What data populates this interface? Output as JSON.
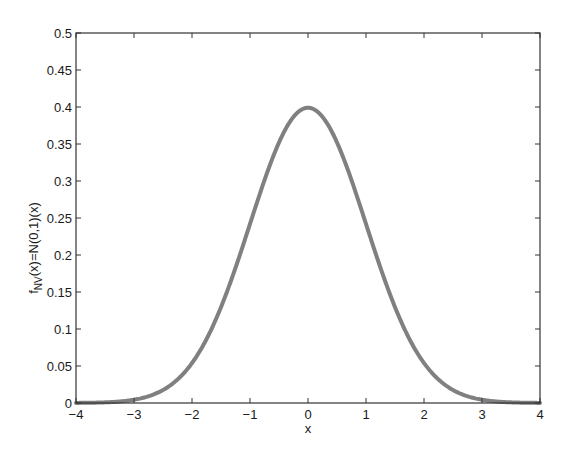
{
  "chart_data": {
    "type": "line",
    "title": "",
    "xlabel": "x",
    "ylabel": "f_NV(x)=N(0,1)(x)",
    "ylabel_parts": {
      "main": "f",
      "sub": "NV",
      "rest": "(x)=N(0,1)(x)"
    },
    "xlim": [
      -4,
      4
    ],
    "ylim": [
      0,
      0.5
    ],
    "xticks": [
      -4,
      -3,
      -2,
      -1,
      0,
      1,
      2,
      3,
      4
    ],
    "xtick_labels": [
      "-4",
      "-3",
      "-2",
      "-1",
      "0",
      "1",
      "2",
      "3",
      "4"
    ],
    "yticks": [
      0,
      0.05,
      0.1,
      0.15,
      0.2,
      0.25,
      0.3,
      0.35,
      0.4,
      0.45,
      0.5
    ],
    "ytick_labels": [
      "0",
      "0.05",
      "0.1",
      "0.15",
      "0.2",
      "0.25",
      "0.3",
      "0.35",
      "0.4",
      "0.45",
      "0.5"
    ],
    "grid": false,
    "legend": null,
    "series": [
      {
        "name": "N(0,1) pdf",
        "color": "#808080",
        "function": "standard_normal_pdf",
        "x": [
          -4,
          -3.5,
          -3,
          -2.5,
          -2,
          -1.5,
          -1,
          -0.5,
          0,
          0.5,
          1,
          1.5,
          2,
          2.5,
          3,
          3.5,
          4
        ],
        "y": [
          0.0001,
          0.0009,
          0.0044,
          0.0175,
          0.054,
          0.1295,
          0.242,
          0.3521,
          0.3989,
          0.3521,
          0.242,
          0.1295,
          0.054,
          0.0175,
          0.0044,
          0.0009,
          0.0001
        ]
      }
    ],
    "colors": {
      "axis": "#333333",
      "curve": "#808080",
      "background": "#ffffff"
    }
  }
}
